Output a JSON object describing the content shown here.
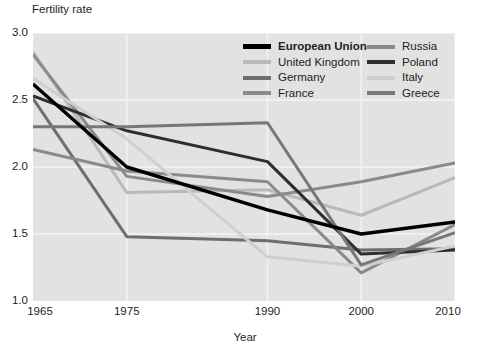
{
  "chart_data": {
    "type": "line",
    "title": "",
    "ylabel": "Fertility rate",
    "xlabel": "Year",
    "x": [
      1965,
      1975,
      1990,
      2000,
      2010
    ],
    "xtick_labels": [
      "1965",
      "1975",
      "1990",
      "2000",
      "2010"
    ],
    "ytick_labels": [
      "1.0",
      "1.5",
      "2.0",
      "2.5",
      "3.0"
    ],
    "ylim": [
      1.0,
      3.0
    ],
    "xlim": [
      1965,
      2010
    ],
    "grid": true,
    "legend_position": "top-right-inside",
    "series": [
      {
        "name": "European Union",
        "color": "#000000",
        "width": 3.4,
        "emphasis": true,
        "values": [
          2.62,
          2.0,
          1.68,
          1.5,
          1.59
        ]
      },
      {
        "name": "United Kingdom",
        "color": "#b9b9b9",
        "width": 3.0,
        "emphasis": false,
        "values": [
          2.86,
          1.81,
          1.83,
          1.64,
          1.92
        ]
      },
      {
        "name": "Germany",
        "color": "#6e6e6e",
        "width": 3.0,
        "emphasis": false,
        "values": [
          2.51,
          1.48,
          1.45,
          1.38,
          1.39
        ]
      },
      {
        "name": "France",
        "color": "#8a8a8a",
        "width": 3.0,
        "emphasis": false,
        "values": [
          2.84,
          1.93,
          1.78,
          1.89,
          2.03
        ]
      },
      {
        "name": "Russia",
        "color": "#8a8a8a",
        "width": 3.0,
        "emphasis": false,
        "values": [
          2.13,
          1.97,
          1.89,
          1.21,
          1.57
        ]
      },
      {
        "name": "Poland",
        "color": "#2e2e2e",
        "width": 3.0,
        "emphasis": false,
        "values": [
          2.53,
          2.27,
          2.04,
          1.35,
          1.38
        ]
      },
      {
        "name": "Italy",
        "color": "#cfcfcf",
        "width": 3.0,
        "emphasis": false,
        "values": [
          2.66,
          2.21,
          1.33,
          1.26,
          1.41
        ]
      },
      {
        "name": "Greece",
        "color": "#777777",
        "width": 3.0,
        "emphasis": false,
        "values": [
          2.3,
          2.3,
          2.33,
          1.27,
          1.51
        ]
      }
    ]
  },
  "legend": {
    "columns": [
      {
        "items": [
          {
            "label": "European Union",
            "color": "#000000",
            "bold": true
          },
          {
            "label": "United Kingdom",
            "color": "#b9b9b9",
            "bold": false
          },
          {
            "label": "Germany",
            "color": "#6e6e6e",
            "bold": false
          },
          {
            "label": "France",
            "color": "#8a8a8a",
            "bold": false
          }
        ]
      },
      {
        "items": [
          {
            "label": "Russia",
            "color": "#8a8a8a",
            "bold": false
          },
          {
            "label": "Poland",
            "color": "#2e2e2e",
            "bold": false
          },
          {
            "label": "Italy",
            "color": "#cfcfcf",
            "bold": false
          },
          {
            "label": "Greece",
            "color": "#777777",
            "bold": false
          }
        ]
      }
    ]
  },
  "style": {
    "plot_background": "#e2e2e2",
    "grid_color": "#f4f4f4",
    "page_background": "#ffffff",
    "text_color": "#231f20"
  }
}
